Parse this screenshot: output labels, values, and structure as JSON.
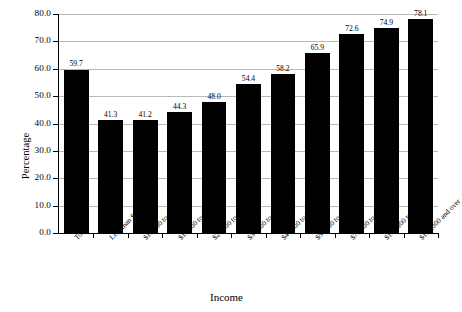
{
  "chart_data": {
    "type": "bar",
    "title": "",
    "xlabel": "Income",
    "ylabel": "Percentage",
    "categories": [
      "Total",
      "Less than $10,000",
      "$10,000 to $14,999",
      "$15,000 to $19,999",
      "$20,000 to $29,999",
      "$30,000 to $39,999",
      "$40,000 to $49,999",
      "$50,000 to $74,999",
      "$75,000 to $99,999",
      "$100,000 to $149,999",
      "$150,000 and over"
    ],
    "values": [
      59.7,
      41.3,
      41.2,
      44.3,
      48.0,
      54.4,
      58.2,
      65.9,
      72.6,
      74.9,
      78.1
    ],
    "value_labels": [
      "59.7",
      "41.3",
      "41.2",
      "44.3",
      "48.0",
      "54.4",
      "58.2",
      "65.9",
      "72.6",
      "74.9",
      "78.1"
    ],
    "ylim": [
      0,
      80
    ],
    "ytick_values": [
      0,
      10,
      20,
      30,
      40,
      50,
      60,
      70,
      80
    ],
    "ytick_labels": [
      "0.0",
      "10.0",
      "20.0",
      "30.0",
      "40.0",
      "50.0",
      "60.0",
      "70.0",
      "80.0"
    ],
    "grid": "horizontal",
    "legend": "none",
    "bar_color": "#000000",
    "gridline_color": "#b9b9b9",
    "axis_color": "#000000",
    "background_color": "#ffffff"
  }
}
